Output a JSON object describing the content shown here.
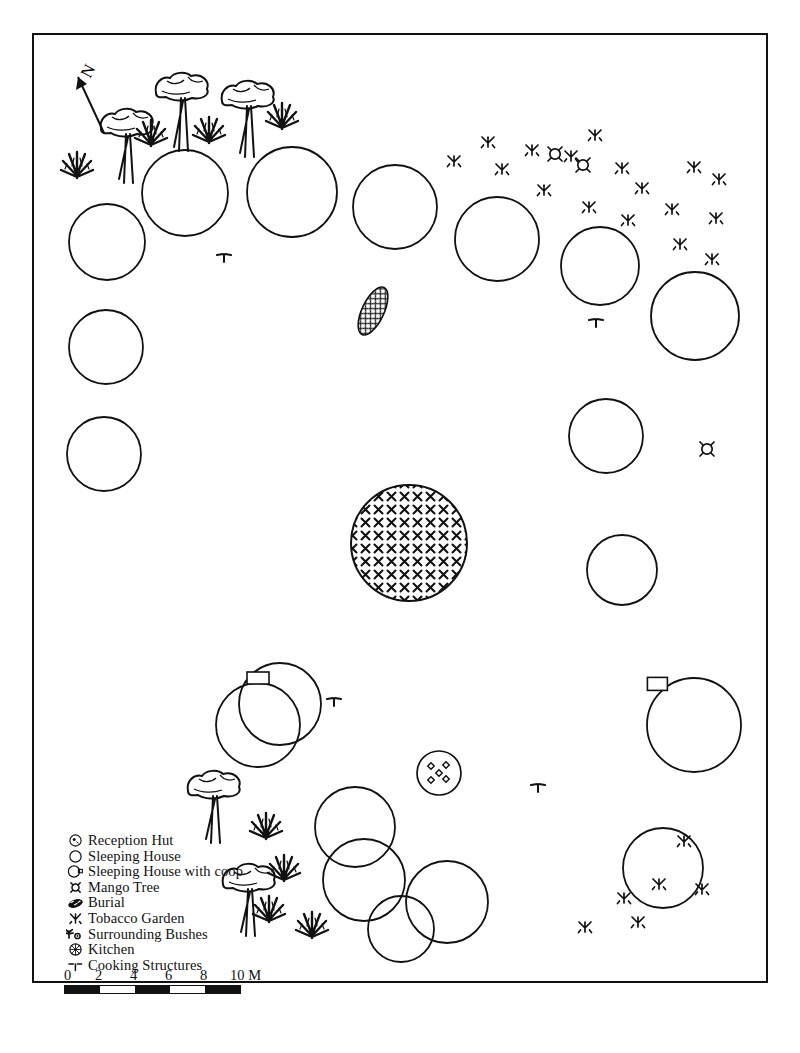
{
  "figure": {
    "type": "archaeological-site-plan",
    "border": true,
    "background_color": "#ffffff",
    "line_color": "#111111"
  },
  "north_arrow": {
    "label": "N",
    "direction": "up-left",
    "name": "north-arrow"
  },
  "legend": {
    "items": [
      {
        "symbol": "reception-hut-icon",
        "label": "Reception Hut"
      },
      {
        "symbol": "sleeping-house-icon",
        "label": "Sleeping House"
      },
      {
        "symbol": "sleeping-house-coop-icon",
        "label": "Sleeping House with coop"
      },
      {
        "symbol": "mango-tree-icon",
        "label": "Mango Tree"
      },
      {
        "symbol": "burial-icon",
        "label": "Burial"
      },
      {
        "symbol": "tobacco-garden-icon",
        "label": "Tobacco Garden"
      },
      {
        "symbol": "surrounding-bushes-icon",
        "label": "Surrounding Bushes"
      },
      {
        "symbol": "kitchen-icon",
        "label": "Kitchen"
      },
      {
        "symbol": "cooking-structures-icon",
        "label": "Cooking Structures"
      }
    ]
  },
  "scale_bar": {
    "ticks": [
      "0",
      "2",
      "4",
      "6",
      "8",
      "10 M"
    ],
    "unit": "M",
    "max": 10,
    "segments": 5
  },
  "map_features": {
    "sleeping_houses": [
      {
        "cx": 73,
        "cy": 207,
        "r": 38
      },
      {
        "cx": 151,
        "cy": 158,
        "r": 43
      },
      {
        "cx": 258,
        "cy": 157,
        "r": 45
      },
      {
        "cx": 361,
        "cy": 172,
        "r": 42
      },
      {
        "cx": 463,
        "cy": 204,
        "r": 42
      },
      {
        "cx": 566,
        "cy": 231,
        "r": 39
      },
      {
        "cx": 661,
        "cy": 281,
        "r": 44
      },
      {
        "cx": 72,
        "cy": 312,
        "r": 37
      },
      {
        "cx": 70,
        "cy": 419,
        "r": 37
      },
      {
        "cx": 572,
        "cy": 401,
        "r": 37
      },
      {
        "cx": 588,
        "cy": 535,
        "r": 35
      },
      {
        "cx": 246,
        "cy": 669,
        "r": 41
      },
      {
        "cx": 321,
        "cy": 792,
        "r": 40
      },
      {
        "cx": 330,
        "cy": 845,
        "r": 41
      },
      {
        "cx": 413,
        "cy": 867,
        "r": 41
      },
      {
        "cx": 367,
        "cy": 894,
        "r": 33
      },
      {
        "cx": 629,
        "cy": 833,
        "r": 40
      }
    ],
    "sleeping_houses_with_coop": [
      {
        "cx": 224,
        "cy": 690,
        "r": 42,
        "coop_side": "top"
      },
      {
        "cx": 660,
        "cy": 690,
        "r": 47,
        "coop_side": "top-left"
      }
    ],
    "reception_hut": {
      "cx": 375,
      "cy": 508,
      "r": 58,
      "fill": "cross-hatch"
    },
    "kitchen": {
      "cx": 405,
      "cy": 738,
      "r": 22,
      "dots": 5
    },
    "burial": {
      "cx": 339,
      "cy": 276,
      "rx": 11,
      "ry": 26,
      "rotation": 25
    },
    "mango_trees": [
      {
        "cx": 521,
        "cy": 119
      },
      {
        "cx": 549,
        "cy": 130
      },
      {
        "cx": 673,
        "cy": 414
      }
    ],
    "tobacco_gardens": [
      {
        "cx": 420,
        "cy": 125
      },
      {
        "cx": 454,
        "cy": 106
      },
      {
        "cx": 498,
        "cy": 114
      },
      {
        "cx": 468,
        "cy": 133
      },
      {
        "cx": 537,
        "cy": 120
      },
      {
        "cx": 561,
        "cy": 99
      },
      {
        "cx": 510,
        "cy": 154
      },
      {
        "cx": 588,
        "cy": 132
      },
      {
        "cx": 608,
        "cy": 152
      },
      {
        "cx": 660,
        "cy": 131
      },
      {
        "cx": 685,
        "cy": 143
      },
      {
        "cx": 555,
        "cy": 171
      },
      {
        "cx": 594,
        "cy": 184
      },
      {
        "cx": 638,
        "cy": 173
      },
      {
        "cx": 682,
        "cy": 182
      },
      {
        "cx": 646,
        "cy": 208
      },
      {
        "cx": 678,
        "cy": 223
      },
      {
        "cx": 650,
        "cy": 805
      },
      {
        "cx": 625,
        "cy": 848
      },
      {
        "cx": 590,
        "cy": 862
      },
      {
        "cx": 668,
        "cy": 853
      },
      {
        "cx": 604,
        "cy": 886
      },
      {
        "cx": 551,
        "cy": 891
      }
    ],
    "surrounding_bushes": [
      {
        "cx": 43,
        "cy": 117
      },
      {
        "cx": 117,
        "cy": 85
      },
      {
        "cx": 175,
        "cy": 82
      },
      {
        "cx": 248,
        "cy": 68
      },
      {
        "cx": 232,
        "cy": 778
      },
      {
        "cx": 250,
        "cy": 820
      },
      {
        "cx": 235,
        "cy": 861
      },
      {
        "cx": 278,
        "cy": 877
      }
    ],
    "trees": [
      {
        "cx": 93,
        "cy": 90,
        "h": 58
      },
      {
        "cx": 148,
        "cy": 54,
        "h": 62
      },
      {
        "cx": 214,
        "cy": 62,
        "h": 60
      },
      {
        "cx": 180,
        "cy": 752,
        "h": 56
      },
      {
        "cx": 215,
        "cy": 845,
        "h": 56
      }
    ],
    "cooking_structures": [
      {
        "cx": 190,
        "cy": 222
      },
      {
        "cx": 562,
        "cy": 287
      },
      {
        "cx": 300,
        "cy": 666
      },
      {
        "cx": 504,
        "cy": 752
      }
    ]
  }
}
